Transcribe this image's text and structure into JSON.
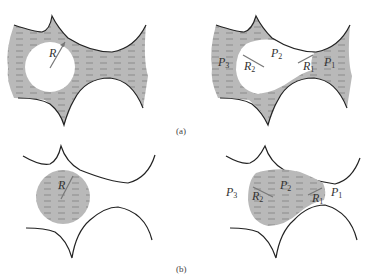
{
  "figure": {
    "panels": [
      {
        "id": "a",
        "caption": "(a)",
        "left": {
          "radius_label": "R"
        },
        "right": {
          "labels": {
            "p3": "P",
            "p3_sub": "3",
            "p2": "P",
            "p2_sub": "2",
            "p1": "P",
            "p1_sub": "1",
            "r2": "R",
            "r2_sub": "2",
            "r1": "R",
            "r1_sub": "1"
          }
        }
      },
      {
        "id": "b",
        "caption": "(b)",
        "left": {
          "radius_label": "R"
        },
        "right": {
          "labels": {
            "p3": "P",
            "p3_sub": "3",
            "p2": "P",
            "p2_sub": "2",
            "p1": "P",
            "p1_sub": "1",
            "r2": "R",
            "r2_sub": "2",
            "r1": "R",
            "r1_sub": "1"
          }
        }
      }
    ],
    "colors": {
      "fluid_fill": "#b4b4b4",
      "dash": "#8a8a8a",
      "wall": "#222222",
      "arrow": "#777777"
    }
  }
}
